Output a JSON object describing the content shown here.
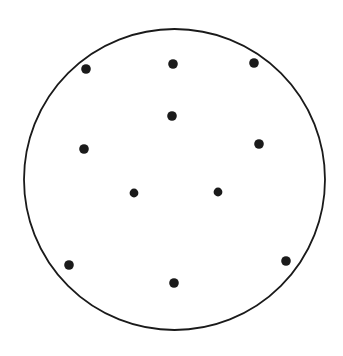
{
  "figure": {
    "title": "",
    "caption": "",
    "type": "point-scatter-in-circle",
    "background_color": "#ffffff",
    "canvas": {
      "width": 343,
      "height": 356
    }
  },
  "chart_data": {
    "type": "scatter",
    "title": "",
    "subtitle": "",
    "xlabel": "",
    "ylabel": "",
    "grid": false,
    "legend": null,
    "axis_visible": false,
    "tick_labels": [],
    "annotations": [],
    "xlim": [
      0,
      343
    ],
    "ylim": [
      0,
      356
    ],
    "point_count": 11,
    "point_color": "#1a1a1a",
    "point_radius": 4.6,
    "boundary": {
      "shape": "circle",
      "cx": 174.5,
      "cy": 179.5,
      "r": 150.5,
      "stroke_color": "#1a1a1a",
      "stroke_width": 1.8,
      "fill": "none"
    },
    "points": [
      {
        "id": "p1",
        "x": 86,
        "y": 69,
        "r": 4.8
      },
      {
        "id": "p2",
        "x": 173,
        "y": 64,
        "r": 4.8
      },
      {
        "id": "p3",
        "x": 254,
        "y": 63,
        "r": 4.8
      },
      {
        "id": "p4",
        "x": 172,
        "y": 116,
        "r": 4.8
      },
      {
        "id": "p5",
        "x": 84,
        "y": 149,
        "r": 4.8
      },
      {
        "id": "p6",
        "x": 259,
        "y": 144,
        "r": 4.8
      },
      {
        "id": "p7",
        "x": 134,
        "y": 193,
        "r": 4.4
      },
      {
        "id": "p8",
        "x": 218,
        "y": 192,
        "r": 4.4
      },
      {
        "id": "p9",
        "x": 69,
        "y": 265,
        "r": 4.8
      },
      {
        "id": "p10",
        "x": 174,
        "y": 283,
        "r": 4.8
      },
      {
        "id": "p11",
        "x": 286,
        "y": 261,
        "r": 4.8
      }
    ]
  }
}
